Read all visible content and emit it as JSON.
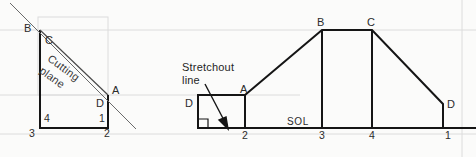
{
  "figure": {
    "title_visible": false,
    "background_color": "#fbfbfa",
    "line_color": "#1a1a1a",
    "guide_color": "#d8d8d8"
  },
  "left_view": {
    "name": "truncated-prism-end-view",
    "vertex_labels": {
      "b": "B",
      "c": "C",
      "a": "A",
      "d": "D"
    },
    "corner_numbers": {
      "n4": "4",
      "n3": "3",
      "n1": "1",
      "n2": "2"
    },
    "cutting_plane_label_line1": "Cutting",
    "cutting_plane_label_line2": "plane"
  },
  "right_view": {
    "name": "stretchout-development",
    "note_line1": "Stretchout",
    "note_line2": "line",
    "sol_label": "SOL",
    "vertex_labels": {
      "d_left": "D",
      "a": "A",
      "b": "B",
      "c": "C",
      "d_right": "D"
    },
    "station_numbers": {
      "s2": "2",
      "s3": "3",
      "s4": "4",
      "s1": "1"
    }
  }
}
